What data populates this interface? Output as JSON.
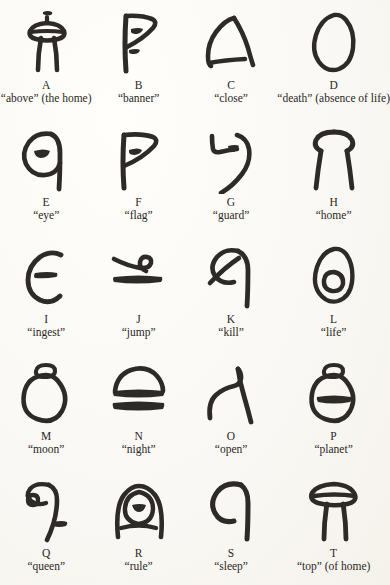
{
  "page": {
    "background_color": "#fdfcfa",
    "ink_color": "#2d2a27",
    "columns": 4,
    "rows": 5
  },
  "glyphs": [
    {
      "letter": "A",
      "gloss": "“above” (the home)",
      "icon": "bulb-with-legs-and-dot-glyph"
    },
    {
      "letter": "B",
      "gloss": "“banner”",
      "icon": "flag-pennant-glyph"
    },
    {
      "letter": "C",
      "gloss": "“close”",
      "icon": "angled-peak-glyph"
    },
    {
      "letter": "D",
      "gloss": "“death” (absence of life)",
      "icon": "empty-egg-glyph"
    },
    {
      "letter": "E",
      "gloss": "“eye”",
      "icon": "oval-with-lid-and-tail-glyph"
    },
    {
      "letter": "F",
      "gloss": "“flag”",
      "icon": "flag-on-pole-glyph"
    },
    {
      "letter": "G",
      "gloss": "“guard”",
      "icon": "hook-with-dot-glyph"
    },
    {
      "letter": "H",
      "gloss": "“home”",
      "icon": "dome-with-two-legs-glyph"
    },
    {
      "letter": "I",
      "gloss": "“ingest”",
      "icon": "open-c-with-bar-glyph"
    },
    {
      "letter": "J",
      "gloss": "“jump”",
      "icon": "loop-over-bar-glyph"
    },
    {
      "letter": "K",
      "gloss": "“kill”",
      "icon": "hooked-oval-struck-through-glyph"
    },
    {
      "letter": "L",
      "gloss": "“life”",
      "icon": "egg-with-inner-circle-glyph"
    },
    {
      "letter": "M",
      "gloss": "“moon”",
      "icon": "circle-with-small-circle-above-glyph"
    },
    {
      "letter": "N",
      "gloss": "“night”",
      "icon": "dome-over-bar-glyph"
    },
    {
      "letter": "O",
      "gloss": "“open”",
      "icon": "curved-hook-and-stroke-glyph"
    },
    {
      "letter": "P",
      "gloss": "“planet”",
      "icon": "circle-with-bar-and-cap-glyph"
    },
    {
      "letter": "Q",
      "gloss": "“queen”",
      "icon": "hook-with-ring-and-dash-glyph"
    },
    {
      "letter": "R",
      "gloss": "“rule”",
      "icon": "arch-with-inner-oval-glyph"
    },
    {
      "letter": "S",
      "gloss": "“sleep”",
      "icon": "open-loop-with-tail-glyph"
    },
    {
      "letter": "T",
      "gloss": "“top” (of home)",
      "icon": "capped-dome-with-legs-glyph"
    }
  ]
}
